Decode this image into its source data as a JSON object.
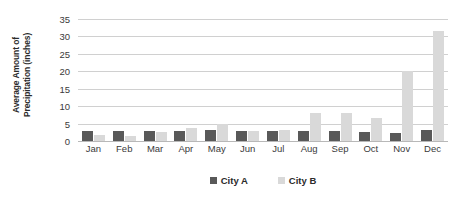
{
  "chart_data": {
    "type": "bar",
    "title": "",
    "subtitle": "",
    "xlabel": "",
    "ylabel": "Average Amount of Precipitation (inches)",
    "ylabel_lines": [
      "Average Amount of",
      "Precipitation (inches)"
    ],
    "ylim": [
      0,
      35
    ],
    "ytick_step": 5,
    "yticks": [
      35,
      30,
      25,
      20,
      15,
      10,
      5,
      0
    ],
    "ytick_labels": [
      "35",
      "30",
      "25",
      "20",
      "15",
      "10",
      "5",
      "0"
    ],
    "grid": true,
    "grid_axis": "y",
    "legend_position": "bottom-center",
    "categories": [
      "Jan",
      "Feb",
      "Mar",
      "Apr",
      "May",
      "Jun",
      "Jul",
      "Aug",
      "Sep",
      "Oct",
      "Nov",
      "Dec"
    ],
    "series": [
      {
        "name": "City A",
        "color": "#595959",
        "values": [
          3,
          3,
          3,
          3,
          3.2,
          3,
          3,
          3,
          3,
          2.5,
          2.3,
          3.2
        ]
      },
      {
        "name": "City B",
        "color": "#d9d9d9",
        "values": [
          1.7,
          1.5,
          2.5,
          3.8,
          4.8,
          3,
          3.2,
          8,
          8,
          6.5,
          20,
          31.5
        ]
      }
    ]
  },
  "legend": {
    "items": [
      {
        "label": "City A",
        "color": "#595959"
      },
      {
        "label": "City B",
        "color": "#d9d9d9"
      }
    ]
  },
  "colors": {
    "series_a": "#595959",
    "series_b": "#d9d9d9",
    "gridline": "#d0d0d0",
    "axis": "#b8b8b8",
    "text": "#2b2b2b",
    "background": "#ffffff"
  }
}
